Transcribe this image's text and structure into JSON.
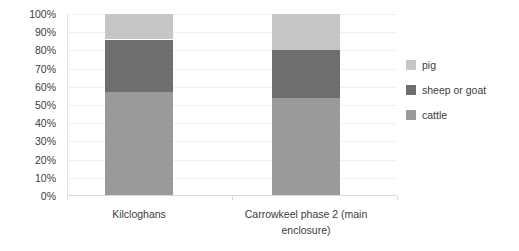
{
  "chart_data": {
    "type": "bar",
    "subtype": "stacked-percentage",
    "title": "",
    "xlabel": "",
    "ylabel": "",
    "ylim": [
      0,
      100
    ],
    "y_tick_labels": [
      "0%",
      "10%",
      "20%",
      "30%",
      "40%",
      "50%",
      "60%",
      "70%",
      "80%",
      "90%",
      "100%"
    ],
    "y_tick_values": [
      0,
      10,
      20,
      30,
      40,
      50,
      60,
      70,
      80,
      90,
      100
    ],
    "grid": true,
    "grid_axis": "y",
    "legend_position": "right",
    "categories": [
      "Kilcloghans",
      "Carrowkeel phase 2 (main enclosure)"
    ],
    "series": [
      {
        "name": "cattle",
        "color": "#9a9a9a",
        "values": [
          57,
          54
        ]
      },
      {
        "name": "sheep or goat",
        "color": "#6e6e6e",
        "values": [
          29,
          26
        ]
      },
      {
        "name": "pig",
        "color": "#c6c6c6",
        "values": [
          14,
          20
        ]
      }
    ],
    "stack_order_bottom_to_top": [
      "cattle",
      "sheep or goat",
      "pig"
    ],
    "legend_order_top_to_bottom": [
      "pig",
      "sheep or goat",
      "cattle"
    ]
  },
  "colors": {
    "pig": "#c6c6c6",
    "sheep_or_goat": "#6e6e6e",
    "cattle": "#9a9a9a",
    "gridline": "#f0f0f0",
    "axis": "#d9d9d9",
    "text": "#3b3b3b",
    "background": "#ffffff"
  },
  "legend": {
    "items": [
      {
        "label": "pig",
        "color": "#c6c6c6"
      },
      {
        "label": "sheep or goat",
        "color": "#6e6e6e"
      },
      {
        "label": "cattle",
        "color": "#9a9a9a"
      }
    ]
  }
}
